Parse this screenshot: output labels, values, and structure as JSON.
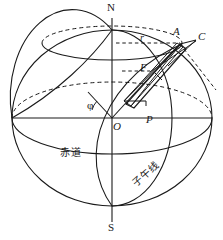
{
  "figure": {
    "type": "geometry-diagram",
    "background_color": "#ffffff",
    "stroke_color": "#1a1a1a",
    "labels": {
      "north_pole": "N",
      "south_pole": "S",
      "center": "O",
      "point_p": "P",
      "point_a": "A",
      "point_c": "C",
      "point_f": "F",
      "radius_r": "r",
      "latitude_angle": "φ",
      "equator": "赤道",
      "meridian": "子午线"
    }
  }
}
